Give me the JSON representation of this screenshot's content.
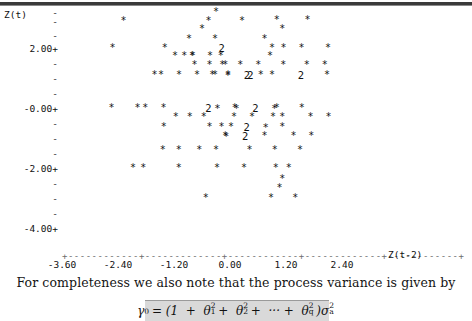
{
  "page": {
    "top_rule": true,
    "body_text": "For completeness we also note that the process variance is given by",
    "formula_plain": "γ0 = (1 + θ1² + θ2² + ⋯ + θq²)σa²"
  },
  "chart_data": {
    "type": "scatter",
    "title": "",
    "ylabel": "Z(t)",
    "xlabel": "Z(t-2)",
    "xtick_labels": [
      "-3.60",
      "-2.40",
      "-1.20",
      "0.00",
      "1.20",
      "2.40"
    ],
    "xticks": [
      -3.6,
      -2.4,
      -1.2,
      0.0,
      1.2,
      2.4
    ],
    "ytick_labels": [
      "2.00+",
      "-0.00+",
      "-2.00+",
      "-4.00+"
    ],
    "yticks": [
      2.0,
      -0.0,
      -2.0,
      -4.0
    ],
    "ylim": [
      -4.6,
      3.4
    ],
    "xlim": [
      -3.9,
      3.1
    ],
    "grid": false,
    "legend": null,
    "marker": "*",
    "overlap_marker": "2",
    "note": "Minitab-style character plot; '2' denotes two coincident observations.",
    "points": [
      {
        "x": -0.3,
        "y": 3.2,
        "m": "*"
      },
      {
        "x": -2.28,
        "y": 2.9,
        "m": "*"
      },
      {
        "x": -0.46,
        "y": 2.9,
        "m": "*"
      },
      {
        "x": 0.26,
        "y": 2.9,
        "m": "*"
      },
      {
        "x": 1.0,
        "y": 2.92,
        "m": "*"
      },
      {
        "x": 1.66,
        "y": 2.92,
        "m": "*"
      },
      {
        "x": -0.6,
        "y": 2.62,
        "m": "*"
      },
      {
        "x": 1.12,
        "y": 2.62,
        "m": "*"
      },
      {
        "x": -0.88,
        "y": 2.3,
        "m": "*"
      },
      {
        "x": -0.32,
        "y": 2.3,
        "m": "*"
      },
      {
        "x": 0.74,
        "y": 2.3,
        "m": "*"
      },
      {
        "x": -2.52,
        "y": 2.0,
        "m": "*"
      },
      {
        "x": -1.4,
        "y": 2.0,
        "m": "*"
      },
      {
        "x": -0.18,
        "y": 2.0,
        "m": "2"
      },
      {
        "x": 0.9,
        "y": 2.0,
        "m": "*"
      },
      {
        "x": 1.34,
        "y": 2.0,
        "m": "**"
      },
      {
        "x": 2.1,
        "y": 2.0,
        "m": "*"
      },
      {
        "x": -1.18,
        "y": 1.72,
        "m": "*"
      },
      {
        "x": -0.98,
        "y": 1.72,
        "m": "*"
      },
      {
        "x": -0.8,
        "y": 1.72,
        "m": "*"
      },
      {
        "x": -0.62,
        "y": 1.72,
        "m": "**"
      },
      {
        "x": -0.2,
        "y": 1.72,
        "m": "*"
      },
      {
        "x": 0.86,
        "y": 1.72,
        "m": "*"
      },
      {
        "x": -0.76,
        "y": 1.42,
        "m": "*"
      },
      {
        "x": -0.44,
        "y": 1.42,
        "m": "*"
      },
      {
        "x": -0.1,
        "y": 1.42,
        "m": "*"
      },
      {
        "x": 0.22,
        "y": 1.42,
        "m": "***"
      },
      {
        "x": 1.14,
        "y": 1.42,
        "m": "*"
      },
      {
        "x": 1.84,
        "y": 1.42,
        "m": "**"
      },
      {
        "x": -1.62,
        "y": 1.1,
        "m": "*"
      },
      {
        "x": -0.9,
        "y": 1.1,
        "m": "****"
      },
      {
        "x": -0.38,
        "y": 1.1,
        "m": "*"
      },
      {
        "x": -0.04,
        "y": 1.1,
        "m": "*"
      },
      {
        "x": 0.16,
        "y": 1.1,
        "m": "*2"
      },
      {
        "x": 0.44,
        "y": 1.1,
        "m": "2"
      },
      {
        "x": 0.66,
        "y": 1.1,
        "m": "*"
      },
      {
        "x": 0.9,
        "y": 1.1,
        "m": "*"
      },
      {
        "x": 1.52,
        "y": 1.1,
        "m": "2"
      },
      {
        "x": 2.08,
        "y": 1.1,
        "m": "*"
      },
      {
        "x": -2.54,
        "y": 0.0,
        "m": "*"
      },
      {
        "x": -1.98,
        "y": 0.0,
        "m": "*"
      },
      {
        "x": -1.62,
        "y": 0.0,
        "m": "**"
      },
      {
        "x": -0.46,
        "y": 0.0,
        "m": "2"
      },
      {
        "x": 0.1,
        "y": 0.0,
        "m": "*"
      },
      {
        "x": 0.34,
        "y": 0.0,
        "m": "**2*"
      },
      {
        "x": 1.0,
        "y": 0.0,
        "m": "*"
      },
      {
        "x": 1.54,
        "y": 0.0,
        "m": "*"
      },
      {
        "x": -1.16,
        "y": -0.3,
        "m": "*"
      },
      {
        "x": -0.86,
        "y": -0.3,
        "m": "*"
      },
      {
        "x": -0.56,
        "y": -0.3,
        "m": "*"
      },
      {
        "x": 0.28,
        "y": -0.3,
        "m": "**"
      },
      {
        "x": 0.92,
        "y": -0.3,
        "m": "*"
      },
      {
        "x": 1.12,
        "y": -0.3,
        "m": "*"
      },
      {
        "x": 1.92,
        "y": -0.3,
        "m": "**"
      },
      {
        "x": -1.42,
        "y": -0.62,
        "m": "*"
      },
      {
        "x": -0.44,
        "y": -0.62,
        "m": "*"
      },
      {
        "x": -0.18,
        "y": -0.62,
        "m": "*"
      },
      {
        "x": 0.02,
        "y": -0.62,
        "m": "*"
      },
      {
        "x": 0.56,
        "y": -0.62,
        "m": "2*"
      },
      {
        "x": 1.12,
        "y": -0.62,
        "m": "*"
      },
      {
        "x": -0.1,
        "y": -0.92,
        "m": "*"
      },
      {
        "x": 0.12,
        "y": -0.92,
        "m": "*2"
      },
      {
        "x": 0.74,
        "y": -0.92,
        "m": "*"
      },
      {
        "x": 1.36,
        "y": -0.92,
        "m": "*"
      },
      {
        "x": 1.74,
        "y": -0.92,
        "m": "*"
      },
      {
        "x": -1.44,
        "y": -1.4,
        "m": "*"
      },
      {
        "x": -1.1,
        "y": -1.4,
        "m": "*"
      },
      {
        "x": -0.66,
        "y": -1.4,
        "m": "*"
      },
      {
        "x": -0.3,
        "y": -1.4,
        "m": "*"
      },
      {
        "x": 0.42,
        "y": -1.4,
        "m": "*"
      },
      {
        "x": 0.96,
        "y": -1.4,
        "m": "*"
      },
      {
        "x": 1.5,
        "y": -1.4,
        "m": "*"
      },
      {
        "x": -2.08,
        "y": -2.0,
        "m": "*"
      },
      {
        "x": -1.86,
        "y": -2.0,
        "m": "*"
      },
      {
        "x": -1.1,
        "y": -2.0,
        "m": "*"
      },
      {
        "x": -0.28,
        "y": -2.0,
        "m": "*"
      },
      {
        "x": 0.3,
        "y": -2.0,
        "m": "*"
      },
      {
        "x": 0.98,
        "y": -2.0,
        "m": "*"
      },
      {
        "x": 1.26,
        "y": -2.0,
        "m": "*"
      },
      {
        "x": 1.12,
        "y": -2.38,
        "m": "*"
      },
      {
        "x": 1.06,
        "y": -2.68,
        "m": "*"
      },
      {
        "x": -0.52,
        "y": -3.0,
        "m": "*"
      },
      {
        "x": 0.88,
        "y": -3.0,
        "m": "*"
      },
      {
        "x": 1.4,
        "y": -3.0,
        "m": "*"
      }
    ]
  }
}
